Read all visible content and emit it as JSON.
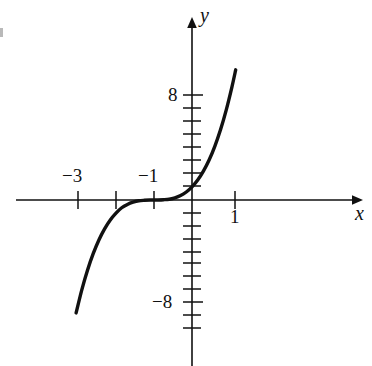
{
  "figure": {
    "kind": "cartesian-graph",
    "background_color": "#ffffff",
    "ink_color": "#111111"
  },
  "axis_labels": {
    "x": "x",
    "y": "y"
  },
  "labels": {
    "x_neg3": "−3",
    "x_neg1": "−1",
    "x_pos1": "1",
    "y_pos8": "8",
    "y_neg8": "−8"
  },
  "chart_data": {
    "type": "line",
    "title": "",
    "subtitle": "",
    "xlabel": "x",
    "ylabel": "y",
    "grid": false,
    "legend": null,
    "function": "y = (x + 1)^3",
    "xlim": [
      -4.65,
      4.6
    ],
    "ylim": [
      -15.6,
      15.7
    ],
    "x_ticks": [
      -3,
      -2,
      -1,
      1
    ],
    "x_tick_labels": [
      "−3",
      "",
      "−1",
      "1"
    ],
    "x_labeled_ticks": [
      -3,
      -1,
      1
    ],
    "y_ticks": [
      -12,
      -11,
      -10,
      -9,
      -8,
      -7,
      -6,
      -5,
      -4,
      -3,
      -2,
      -1,
      1,
      2,
      3,
      4,
      5,
      6,
      7,
      8
    ],
    "y_labeled_ticks": [
      8,
      -8
    ],
    "y_tick_labels_shown": [
      "8",
      "−8"
    ],
    "x_axis_arrow": "right",
    "y_axis_arrow": "up",
    "series": [
      {
        "name": "y = (x + 1)^3",
        "x": [
          -3.05,
          -2.9,
          -2.75,
          -2.6,
          -2.45,
          -2.3,
          -2.15,
          -2.0,
          -1.85,
          -1.7,
          -1.55,
          -1.4,
          -1.25,
          -1.1,
          -1.0,
          -0.9,
          -0.75,
          -0.6,
          -0.45,
          -0.3,
          -0.15,
          0.0,
          0.15,
          0.3,
          0.45,
          0.6,
          0.75,
          0.9,
          1.05,
          1.15
        ],
        "y": [
          -8.62,
          -6.86,
          -5.36,
          -4.1,
          -3.05,
          -2.2,
          -1.52,
          -1.0,
          -0.59,
          -0.34,
          -0.17,
          -0.06,
          -0.02,
          -0.001,
          0.0,
          0.001,
          0.02,
          0.06,
          0.17,
          0.34,
          0.61,
          1.0,
          1.52,
          2.2,
          3.05,
          4.1,
          5.36,
          6.86,
          8.62,
          9.94
        ]
      }
    ],
    "curve_endpoints": {
      "lower_left": [
        -3.05,
        -8.62
      ],
      "upper_right": [
        1.15,
        9.94
      ]
    },
    "inflection_point": [
      -1,
      0
    ],
    "y_intercept": [
      0,
      1
    ],
    "x_intercept": [
      -1,
      0
    ]
  }
}
